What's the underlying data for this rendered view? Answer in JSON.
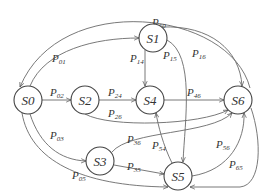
{
  "diagram": {
    "type": "state-transition",
    "colors": {
      "stroke": "#6a6a6a",
      "node_stroke": "#444444",
      "text": "#333333",
      "background": "#ffffff"
    },
    "nodes": [
      {
        "id": "S0",
        "label": "S0",
        "x": 28,
        "y": 100
      },
      {
        "id": "S1",
        "label": "S1",
        "x": 153,
        "y": 38
      },
      {
        "id": "S2",
        "label": "S2",
        "x": 85,
        "y": 100
      },
      {
        "id": "S3",
        "label": "S3",
        "x": 100,
        "y": 161
      },
      {
        "id": "S4",
        "label": "S4",
        "x": 150,
        "y": 100
      },
      {
        "id": "S5",
        "label": "S5",
        "x": 178,
        "y": 176
      },
      {
        "id": "S6",
        "label": "S6",
        "x": 238,
        "y": 100
      }
    ],
    "edges": [
      {
        "from": "S0",
        "to": "S1",
        "label": "P",
        "sub": "01"
      },
      {
        "from": "S0",
        "to": "S2",
        "label": "P",
        "sub": "02"
      },
      {
        "from": "S0",
        "to": "S3",
        "label": "P",
        "sub": "03"
      },
      {
        "from": "S0",
        "to": "S5",
        "label": "P",
        "sub": "05"
      },
      {
        "from": "S1",
        "to": "S4",
        "label": "P",
        "sub": "14"
      },
      {
        "from": "S1",
        "to": "S5",
        "label": "P",
        "sub": "15"
      },
      {
        "from": "S1",
        "to": "S6",
        "label": "P",
        "sub": "16"
      },
      {
        "from": "S2",
        "to": "S4",
        "label": "P",
        "sub": "24"
      },
      {
        "from": "S2",
        "to": "S6",
        "label": "P",
        "sub": "26"
      },
      {
        "from": "S3",
        "to": "S6",
        "label": "P",
        "sub": "36"
      },
      {
        "from": "S3",
        "to": "S5",
        "label": "P",
        "sub": "35"
      },
      {
        "from": "S4",
        "to": "S6",
        "label": "P",
        "sub": "46"
      },
      {
        "from": "S5",
        "to": "S4",
        "label": "P",
        "sub": "54"
      },
      {
        "from": "S5",
        "to": "S6",
        "label": "P",
        "sub": "56"
      },
      {
        "from": "S6",
        "to": "S5",
        "label": "P",
        "sub": "65"
      },
      {
        "from": "S6",
        "to": "S0",
        "label": "P",
        "sub": "60"
      }
    ]
  }
}
